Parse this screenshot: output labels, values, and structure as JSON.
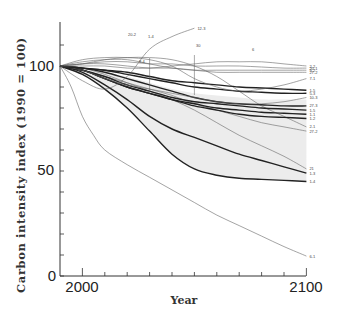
{
  "chart_data": {
    "type": "line",
    "title": "",
    "xlabel": "Year",
    "ylabel": "Carbon intensity index (1990 = 100)",
    "xlim": [
      1990,
      2100
    ],
    "ylim": [
      0,
      120
    ],
    "x_ticks": [
      2000,
      2100
    ],
    "x_minor_ticks": [
      2010,
      2020,
      2030,
      2040,
      2050,
      2060,
      2070,
      2080,
      2090
    ],
    "y_ticks": [
      0,
      50,
      100
    ],
    "grid": false,
    "legend": "inline labels at right end of each line",
    "shaded_band": {
      "description": "grey envelope between upper and lower bold scenarios",
      "color": "#ececec",
      "upper": [
        [
          1990,
          100
        ],
        [
          2000,
          99
        ],
        [
          2010,
          97
        ],
        [
          2020,
          95
        ],
        [
          2030,
          92
        ],
        [
          2040,
          89
        ],
        [
          2050,
          87
        ],
        [
          2060,
          86
        ],
        [
          2070,
          85
        ],
        [
          2080,
          84
        ],
        [
          2090,
          84
        ],
        [
          2100,
          84
        ]
      ],
      "lower": [
        [
          1990,
          100
        ],
        [
          2000,
          96
        ],
        [
          2010,
          89
        ],
        [
          2020,
          80
        ],
        [
          2030,
          69
        ],
        [
          2040,
          58
        ],
        [
          2050,
          51
        ],
        [
          2060,
          48
        ],
        [
          2070,
          46.5
        ],
        [
          2080,
          46
        ],
        [
          2090,
          45.5
        ],
        [
          2100,
          45
        ]
      ]
    },
    "series": [
      {
        "name": "1-4",
        "weight": "bold",
        "x": [
          1990,
          2000,
          2010,
          2020,
          2030,
          2040,
          2050,
          2060,
          2070,
          2080,
          2090,
          2100
        ],
        "values": [
          100,
          96,
          89,
          80,
          69,
          58,
          51,
          48,
          46.5,
          46,
          45.5,
          45
        ]
      },
      {
        "name": "1-3",
        "weight": "bold",
        "x": [
          1990,
          2000,
          2010,
          2020,
          2030,
          2040,
          2050,
          2060,
          2070,
          2080,
          2090,
          2100
        ],
        "values": [
          100,
          97,
          91,
          84,
          76,
          70,
          66,
          62,
          58,
          55,
          52,
          49
        ]
      },
      {
        "name": "21",
        "weight": "thin",
        "x": [
          1990,
          2000,
          2010,
          2020,
          2030,
          2040,
          2050,
          2060,
          2070,
          2080,
          2090,
          2100
        ],
        "values": [
          100,
          99,
          96,
          92,
          88,
          84,
          79,
          73,
          67,
          62,
          57,
          51
        ]
      },
      {
        "name": "27-2",
        "weight": "thin",
        "x": [
          1990,
          2000,
          2010,
          2020,
          2030,
          2040,
          2050,
          2060,
          2070,
          2080,
          2090,
          2100
        ],
        "values": [
          100,
          98,
          95,
          92,
          89,
          86,
          82,
          79,
          76,
          73,
          71,
          69
        ]
      },
      {
        "name": "2-1",
        "weight": "thin",
        "x": [
          1990,
          2000,
          2010,
          2020,
          2030,
          2040,
          2050,
          2060,
          2070,
          2080,
          2090,
          2100
        ],
        "values": [
          100,
          101,
          103,
          104,
          104,
          103,
          100,
          95,
          88,
          81,
          76,
          71
        ]
      },
      {
        "name": "1-2",
        "weight": "bold",
        "x": [
          1990,
          2000,
          2010,
          2020,
          2030,
          2040,
          2050,
          2060,
          2070,
          2080,
          2090,
          2100
        ],
        "values": [
          100,
          98,
          94,
          90,
          87,
          84,
          81,
          79,
          77,
          76,
          75.5,
          75
        ]
      },
      {
        "name": "1-1",
        "weight": "bold",
        "x": [
          1990,
          2000,
          2010,
          2020,
          2030,
          2040,
          2050,
          2060,
          2070,
          2080,
          2090,
          2100
        ],
        "values": [
          100,
          98,
          94,
          90,
          87,
          84,
          82,
          80,
          79,
          78,
          77.5,
          77
        ]
      },
      {
        "name": "1-5",
        "weight": "bold",
        "x": [
          1990,
          2000,
          2010,
          2020,
          2030,
          2040,
          2050,
          2060,
          2070,
          2080,
          2090,
          2100
        ],
        "values": [
          100,
          98,
          95,
          91,
          88,
          85,
          83,
          82,
          81,
          80,
          79.5,
          79
        ]
      },
      {
        "name": "27-3",
        "weight": "bold",
        "x": [
          1990,
          2000,
          2010,
          2020,
          2030,
          2040,
          2050,
          2060,
          2070,
          2080,
          2090,
          2100
        ],
        "values": [
          100,
          99,
          97,
          94,
          91,
          88,
          85,
          83,
          82,
          81.5,
          81,
          81
        ]
      },
      {
        "name": "10-3",
        "weight": "thin",
        "x": [
          1990,
          2000,
          2010,
          2020,
          2030,
          2040,
          2050,
          2060,
          2070,
          2080,
          2090,
          2100
        ],
        "values": [
          100,
          98,
          94,
          91,
          89,
          87,
          85,
          83,
          82,
          82,
          83,
          85
        ]
      },
      {
        "name": "5-3",
        "weight": "bold",
        "x": [
          1990,
          2000,
          2010,
          2020,
          2030,
          2040,
          2050,
          2060,
          2070,
          2080,
          2090,
          2100
        ],
        "values": [
          100,
          99,
          98,
          96,
          94,
          92,
          90,
          89,
          88,
          87.5,
          87,
          87
        ]
      },
      {
        "name": "1-5b",
        "weight": "bold",
        "x": [
          1990,
          2000,
          2010,
          2020,
          2030,
          2040,
          2050,
          2060,
          2070,
          2080,
          2090,
          2100
        ],
        "values": [
          100,
          99,
          98,
          97,
          95,
          93,
          92,
          91,
          90,
          89.5,
          89,
          88.5
        ]
      },
      {
        "name": "7-1",
        "weight": "thin",
        "x": [
          1990,
          2000,
          2010,
          2020,
          2030,
          2040,
          2050,
          2060,
          2070,
          2080,
          2090,
          2100
        ],
        "values": [
          100,
          103,
          104,
          104,
          103,
          100,
          94,
          90,
          88,
          89,
          91,
          94
        ]
      },
      {
        "name": "27-2b",
        "weight": "thin",
        "x": [
          1990,
          2000,
          2010,
          2020,
          2030,
          2040,
          2050,
          2060,
          2070,
          2080,
          2090,
          2100
        ],
        "values": [
          100,
          101,
          101,
          100,
          99,
          99,
          98,
          97,
          97,
          97,
          97,
          97
        ]
      },
      {
        "name": "9-2",
        "weight": "thin",
        "x": [
          1990,
          2000,
          2010,
          2020,
          2030,
          2040,
          2050,
          2060,
          2070,
          2080,
          2090,
          2100
        ],
        "values": [
          100,
          102,
          103,
          103,
          101,
          99,
          98,
          98,
          98,
          98,
          98,
          98
        ]
      },
      {
        "name": "20-1",
        "weight": "thin",
        "x": [
          1990,
          2000,
          2010,
          2020,
          2030,
          2040,
          2050,
          2060,
          2070,
          2080,
          2090,
          2100
        ],
        "values": [
          100,
          101,
          102,
          102,
          101,
          101,
          100,
          100,
          100,
          99.5,
          99,
          99
        ]
      },
      {
        "name": "2-2",
        "weight": "thin",
        "x": [
          1990,
          2000,
          2010,
          2020,
          2030,
          2040,
          2050,
          2060,
          2070,
          2080,
          2090,
          2100
        ],
        "values": [
          100,
          100,
          100,
          99,
          99,
          100,
          101,
          102,
          102,
          102,
          101,
          100
        ]
      },
      {
        "name": "12-3",
        "weight": "thin",
        "x": [
          1990,
          2000,
          2010,
          2020,
          2030,
          2040,
          2050
        ],
        "values": [
          100,
          93,
          89,
          95,
          108,
          114,
          118
        ]
      },
      {
        "name": "6-1",
        "weight": "thin",
        "x": [
          1990,
          1995,
          2000,
          2005,
          2010,
          2020,
          2030,
          2040,
          2050,
          2060,
          2070,
          2080,
          2090,
          2100
        ],
        "values": [
          100,
          90,
          76,
          67,
          60,
          53,
          47,
          41,
          35,
          29,
          24,
          19,
          14,
          9.5
        ]
      }
    ],
    "annotations": [
      "12-3",
      "20-2",
      "1-4",
      "30",
      "6",
      "8-4"
    ],
    "right_labels": [
      "1-2",
      "20-1",
      "9-2",
      "27-2",
      "7-1",
      "5-3",
      "1-5",
      "10-3",
      "27-3",
      "1-5",
      "1-1",
      "1-2",
      "2-1",
      "27-2",
      "21",
      "1-3",
      "1-4",
      "6-1"
    ]
  },
  "axes": {
    "ylabel": "Carbon intensity index (1990 = 100)",
    "xlabel": "Year",
    "ytick_labels": [
      "0",
      "50",
      "100"
    ],
    "xtick_labels": [
      "2000",
      "2100"
    ]
  }
}
